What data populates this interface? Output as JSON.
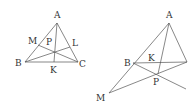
{
  "figures": [
    {
      "id": "left",
      "labels": {
        "A": "A",
        "B": "B",
        "C": "C",
        "M": "M",
        "L": "L",
        "K": "K",
        "P": "P"
      },
      "points": {
        "A": [
          57,
          23
        ],
        "B": [
          25,
          62
        ],
        "C": [
          78,
          62
        ],
        "M": [
          38,
          45
        ],
        "L": [
          70,
          47
        ],
        "K": [
          54,
          62
        ],
        "P": [
          55,
          51
        ]
      }
    },
    {
      "id": "right",
      "labels": {
        "A": "A",
        "B": "B",
        "K": "K",
        "P": "P",
        "M": "M"
      },
      "points": {
        "A": [
          169,
          23
        ],
        "B": [
          133,
          63
        ],
        "C": [
          187,
          62
        ],
        "K": [
          158,
          63
        ],
        "P": [
          158,
          74
        ],
        "M": [
          109,
          93
        ],
        "E": [
          186,
          89
        ]
      }
    }
  ],
  "colors": {
    "line": "#555555",
    "text": "#333333",
    "background": "#ffffff"
  }
}
